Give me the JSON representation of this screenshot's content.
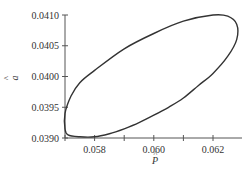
{
  "chart_data": {
    "type": "line",
    "title": "",
    "xlabel": "P̂",
    "ylabel": "â",
    "xlim": [
      0.057,
      0.063
    ],
    "ylim": [
      0.039,
      0.041
    ],
    "x_ticks": [
      0.057,
      0.058,
      0.059,
      0.06,
      0.061,
      0.062
    ],
    "x_tick_labels": [
      "0.058",
      "0.060",
      "0.062"
    ],
    "y_tick_labels": [
      "0.0410",
      "0.0405",
      "0.0400",
      "0.0395",
      "0.0390"
    ],
    "grid": false,
    "legend": null,
    "series": [
      {
        "name": "confidence ellipse",
        "closed": true,
        "x": [
          0.057,
          0.0571,
          0.0575,
          0.058,
          0.0585,
          0.059,
          0.0595,
          0.06,
          0.0605,
          0.061,
          0.0615,
          0.062,
          0.0625,
          0.0628,
          0.0628,
          0.0625,
          0.062,
          0.061,
          0.06,
          0.059,
          0.058,
          0.0575,
          0.0572,
          0.057
        ],
        "y": [
          0.03915,
          0.03905,
          0.03902,
          0.03902,
          0.03907,
          0.03915,
          0.03925,
          0.03937,
          0.0395,
          0.03965,
          0.03985,
          0.04005,
          0.04033,
          0.0406,
          0.04085,
          0.04098,
          0.041,
          0.0409,
          0.0407,
          0.04045,
          0.0401,
          0.0399,
          0.03968,
          0.0394
        ]
      }
    ]
  },
  "labels": {
    "x_axis": "P",
    "x_hat": "^",
    "y_axis": "a",
    "y_hat": "^"
  }
}
